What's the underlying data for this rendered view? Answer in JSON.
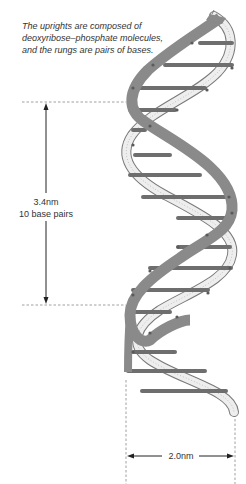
{
  "caption": {
    "lines": [
      "The uprights are composed of",
      "deoxyribose–phosphate molecules,",
      "and the rungs are pairs of bases."
    ]
  },
  "measurements": {
    "pitch": {
      "value": "3.4nm",
      "note": "10 base pairs"
    },
    "width": {
      "value": "2.0nm"
    }
  },
  "colors": {
    "front_strand": "#8a8a8a",
    "back_strand_fill": "#e6e6e6",
    "back_strand_outline": "#7a7a7a",
    "rung": "#6e6e6e",
    "dot": "#5a5a5a",
    "guide": "#888888",
    "arrow": "#222222"
  },
  "helix": {
    "rung_y": [
      43,
      65,
      88,
      110,
      130,
      155,
      175,
      197,
      218,
      247,
      268,
      290,
      312,
      333,
      355,
      375
    ]
  }
}
